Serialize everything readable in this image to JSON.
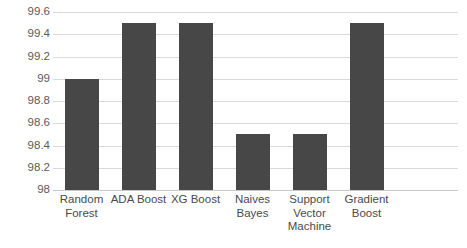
{
  "chart_data": {
    "type": "bar",
    "title": "",
    "subtitle": "",
    "xlabel": "",
    "ylabel": "",
    "categories": [
      "Random Forest",
      "ADA Boost",
      "XG Boost",
      "Naives Bayes",
      "Support Vector Machine",
      "Gradient Boost"
    ],
    "category_lines": [
      [
        "Random",
        "Forest"
      ],
      [
        "ADA Boost"
      ],
      [
        "XG Boost"
      ],
      [
        "Naives",
        "Bayes"
      ],
      [
        "Support",
        "Vector",
        "Machine"
      ],
      [
        "Gradient",
        "Boost"
      ]
    ],
    "values": [
      99.0,
      99.5,
      99.5,
      98.5,
      98.5,
      99.5
    ],
    "ylim": [
      98,
      99.6
    ],
    "ytick_values": [
      99.6,
      99.4,
      99.2,
      99.0,
      98.8,
      98.6,
      98.4,
      98.2,
      98.0
    ],
    "ytick_labels": [
      "99.6",
      "99.4",
      "99.2",
      "99",
      "98.8",
      "98.6",
      "98.4",
      "98.2",
      "98"
    ],
    "grid": true,
    "legend": false,
    "legend_position": "none",
    "bar_color": "#474747",
    "gridline_color": "#d9d9d9",
    "axis_color": "#c8c8c8",
    "background_color": "#ffffff",
    "tick_label_color": "#5a5a5a",
    "category_label_color": "#4a4a4a"
  }
}
